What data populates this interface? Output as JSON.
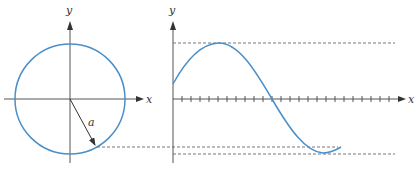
{
  "figure": {
    "colors": {
      "curve": "#4a8fc9",
      "axis": "#555555",
      "dash": "#777777",
      "arrow": "#333333"
    },
    "left_panel": {
      "x_axis_label": "x",
      "y_axis_label": "y",
      "radius_label": "a",
      "circle": {
        "cx": 70,
        "cy": 99,
        "r": 55
      },
      "radius_endpoint": {
        "x": 96,
        "y": 147
      }
    },
    "right_panel": {
      "x_axis_label": "x",
      "y_axis_label": "y",
      "tick_count": 24,
      "reference_lines": [
        "max (y = a)",
        "projection of radius endpoint",
        "min (y = -a)"
      ]
    }
  }
}
